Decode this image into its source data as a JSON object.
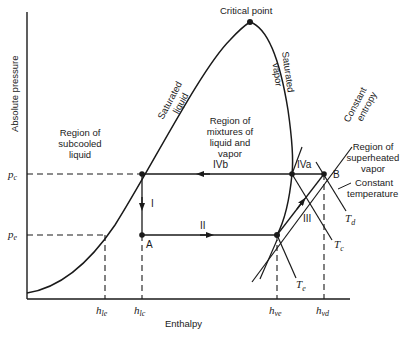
{
  "diagram": {
    "type": "pressure-enthalpy refrigeration cycle",
    "axes": {
      "ylabel": "Absolute pressure",
      "xlabel": "Enthalpy",
      "y_ticks": [
        {
          "base": "p",
          "sub": "c"
        },
        {
          "base": "p",
          "sub": "e"
        }
      ],
      "x_ticks": [
        {
          "base": "h",
          "sub": "le"
        },
        {
          "base": "h",
          "sub": "lc"
        },
        {
          "base": "h",
          "sub": "ve"
        },
        {
          "base": "h",
          "sub": "vd"
        }
      ]
    },
    "curves": {
      "critical_point": "Critical point",
      "saturated_liquid": [
        "Saturated",
        "liquid"
      ],
      "saturated_vapor": [
        "Saturated",
        "vapor"
      ],
      "constant_entropy": [
        "Constant",
        "entropy"
      ],
      "constant_temperature": [
        "Constant",
        "temperature"
      ]
    },
    "regions": {
      "subcooled": [
        "Region of",
        "subcooled",
        "liquid"
      ],
      "mixture": [
        "Region of",
        "mixtures of",
        "liquid and",
        "vapor"
      ],
      "superheated": [
        "Region of",
        "superheated",
        "vapor"
      ]
    },
    "processes": {
      "I": "I",
      "II": "II",
      "III": "III",
      "IVa": "IVa",
      "IVb": "IVb"
    },
    "points": {
      "A": "A",
      "B": "B"
    },
    "isotherms": [
      {
        "base": "T",
        "sub": "d"
      },
      {
        "base": "T",
        "sub": "c"
      },
      {
        "base": "T",
        "sub": "e"
      }
    ],
    "colors": {
      "line": "#1a1a1a",
      "background": "#ffffff"
    }
  }
}
